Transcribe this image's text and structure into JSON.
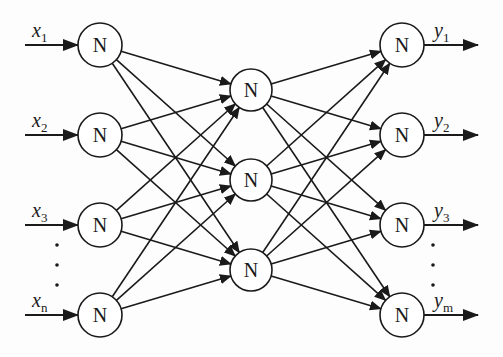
{
  "diagram": {
    "type": "feedforward-neural-network",
    "node_label": "N",
    "colors": {
      "stroke": "#1a1a1a",
      "node_fill": "#ffffff",
      "background": "#fdfdfd"
    },
    "layers": [
      {
        "name": "input",
        "x": 100,
        "r": 22,
        "nodes": [
          {
            "y": 45,
            "label": "x",
            "sub": "1"
          },
          {
            "y": 135,
            "label": "x",
            "sub": "2"
          },
          {
            "y": 225,
            "label": "x",
            "sub": "3"
          },
          {
            "y": 315,
            "label": "x",
            "sub": "n"
          }
        ]
      },
      {
        "name": "hidden",
        "x": 251,
        "r": 21,
        "nodes": [
          {
            "y": 90
          },
          {
            "y": 180
          },
          {
            "y": 270
          }
        ]
      },
      {
        "name": "output",
        "x": 402,
        "r": 22,
        "nodes": [
          {
            "y": 45,
            "label": "y",
            "sub": "1"
          },
          {
            "y": 135,
            "label": "y",
            "sub": "2"
          },
          {
            "y": 225,
            "label": "y",
            "sub": "3"
          },
          {
            "y": 315,
            "label": "y",
            "sub": "m"
          }
        ]
      }
    ],
    "ellipsis": {
      "symbol": "⋮"
    },
    "edges": "fully-connected between adjacent layers"
  }
}
